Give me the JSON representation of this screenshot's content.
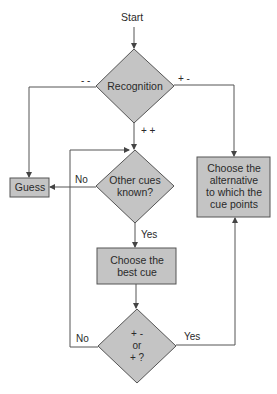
{
  "diagram": {
    "type": "flowchart",
    "colors": {
      "node_fill": "#c4c4c4",
      "node_stroke": "#555555",
      "line": "#555555",
      "text": "#2a2a2a"
    },
    "start_label": "Start",
    "nodes": {
      "recognition": {
        "shape": "diamond",
        "label": "Recognition"
      },
      "guess": {
        "shape": "box",
        "label": "Guess"
      },
      "other_cues": {
        "shape": "diamond",
        "label_line1": "Other cues",
        "label_line2": "known?"
      },
      "choose_alternative": {
        "shape": "box",
        "label_line1": "Choose the",
        "label_line2": "alternative",
        "label_line3": "to which the",
        "label_line4": "cue points"
      },
      "choose_best_cue": {
        "shape": "box",
        "label_line1": "Choose the",
        "label_line2": "best cue"
      },
      "cue_check": {
        "shape": "diamond",
        "label_line1": "+ -",
        "label_line2": "or",
        "label_line3": "+ ?"
      }
    },
    "edges": {
      "recognition_left": "- -",
      "recognition_right": "+ -",
      "recognition_down": "+ +",
      "other_cues_no": "No",
      "other_cues_yes": "Yes",
      "cue_check_no": "No",
      "cue_check_yes": "Yes"
    }
  }
}
